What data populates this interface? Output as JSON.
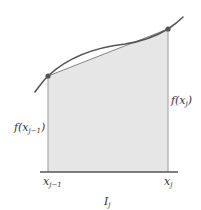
{
  "diagram": {
    "type": "trapezoid-rule-illustration",
    "colors": {
      "background": "#ffffff",
      "fill": "#e6e6e6",
      "curve": "#555555",
      "chord": "#777777",
      "axis": "#555555",
      "verticals": "#9a9a9a",
      "points": "#555555",
      "text": "#333333"
    },
    "points": [
      {
        "name": "left",
        "x": 48,
        "y": 76
      },
      {
        "name": "right",
        "x": 168,
        "y": 29
      }
    ],
    "labels": {
      "f_left": {
        "base": "f(x",
        "sub": "j−1",
        "close": ")"
      },
      "f_right": {
        "base": "f(x",
        "sub": "j",
        "close": ")"
      },
      "x_left": {
        "base": "x",
        "sub": "j−1"
      },
      "x_right": {
        "base": "x",
        "sub": "j"
      },
      "interval": {
        "base": "I",
        "sub": "j"
      }
    }
  }
}
